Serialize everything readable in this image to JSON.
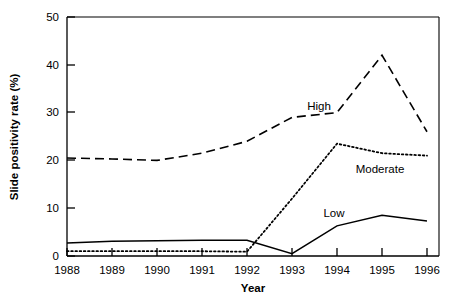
{
  "chart_data": {
    "type": "line",
    "title": "",
    "xlabel": "Year",
    "ylabel": "Slide positivity rate (%)",
    "categories": [
      "1988",
      "1989",
      "1990",
      "1991",
      "1992",
      "1993",
      "1994",
      "1995",
      "1996"
    ],
    "x": [
      1988,
      1989,
      1990,
      1991,
      1992,
      1993,
      1994,
      1995,
      1996
    ],
    "xlim": [
      1988,
      1996
    ],
    "ylim": [
      0,
      50
    ],
    "ytick_labels": [
      "0",
      "10",
      "20",
      "30",
      "40",
      "50"
    ],
    "yticks": [
      0,
      10,
      20,
      30,
      40,
      50
    ],
    "grid": false,
    "legend_position": "inline-annotations",
    "series": [
      {
        "name": "High",
        "style": "dashed",
        "label_x": 1994.5,
        "label_y": 30.5,
        "values": [
          20.5,
          20.3,
          20.0,
          21.5,
          24.0,
          29.0,
          30.0,
          42.0,
          26.0
        ]
      },
      {
        "name": "Moderate",
        "style": "dotted",
        "label_x": 1994.6,
        "label_y": 19.5,
        "values": [
          1.0,
          1.0,
          1.0,
          1.0,
          0.9,
          12.0,
          23.5,
          21.5,
          21.0
        ]
      },
      {
        "name": "Low",
        "style": "solid",
        "label_x": 1993.9,
        "label_y": 11.5,
        "values": [
          2.7,
          3.1,
          3.2,
          3.3,
          3.3,
          0.5,
          6.3,
          8.5,
          7.3
        ]
      }
    ]
  },
  "axis": {
    "x_title": "Year",
    "y_title": "Slide positivity rate (%)"
  },
  "series_labels": {
    "high": "High",
    "moderate": "Moderate",
    "low": "Low"
  },
  "ytick_text": {
    "t0": "0",
    "t10": "10",
    "t20": "20",
    "t30": "30",
    "t40": "40",
    "t50": "50"
  },
  "xtick_text": {
    "y1988": "1988",
    "y1989": "1989",
    "y1990": "1990",
    "y1991": "1991",
    "y1992": "1992",
    "y1993": "1993",
    "y1994": "1994",
    "y1995": "1995",
    "y1996": "1996"
  },
  "colors": {
    "ink": "#000000",
    "background": "#ffffff"
  }
}
